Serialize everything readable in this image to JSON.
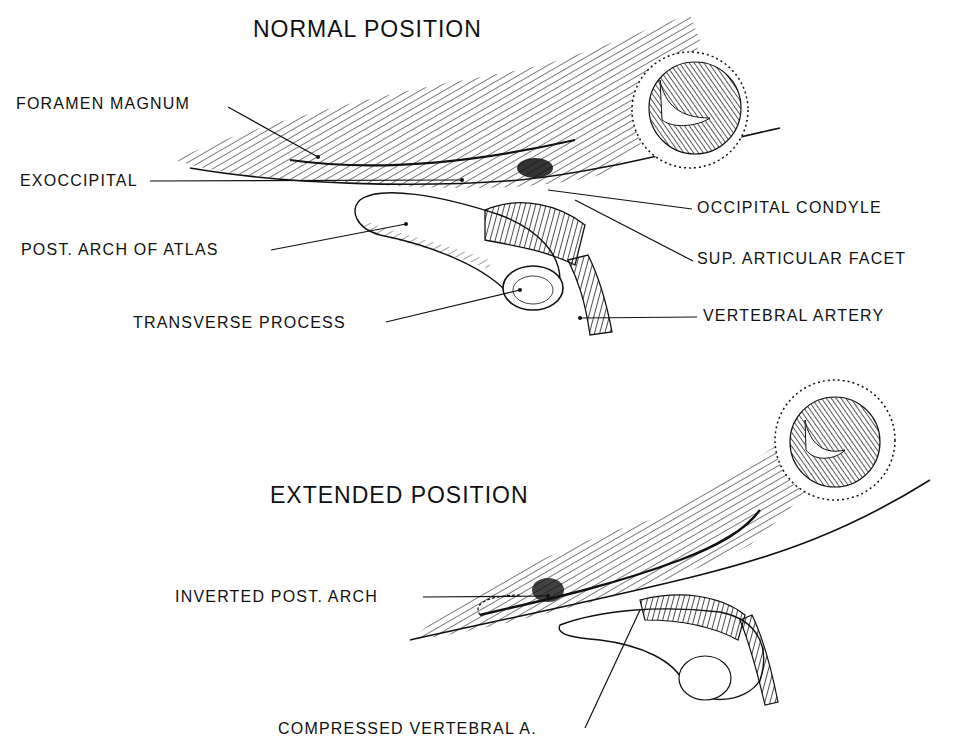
{
  "figure": {
    "panels": [
      {
        "title": "NORMAL POSITION",
        "labels": {
          "foramen_magnum": "FORAMEN MAGNUM",
          "exoccipital": "EXOCCIPITAL",
          "post_arch_of_atlas": "POST. ARCH OF ATLAS",
          "transverse_process": "TRANSVERSE PROCESS",
          "occipital_condyle": "OCCIPITAL CONDYLE",
          "sup_articular_facet": "SUP. ARTICULAR FACET",
          "vertebral_artery": "VERTEBRAL ARTERY"
        }
      },
      {
        "title": "EXTENDED POSITION",
        "labels": {
          "inverted_post_arch": "INVERTED POST. ARCH",
          "compressed_vertebral_a": "COMPRESSED VERTEBRAL A."
        }
      }
    ],
    "colors": {
      "ink": "#111111",
      "background": "#ffffff"
    }
  }
}
